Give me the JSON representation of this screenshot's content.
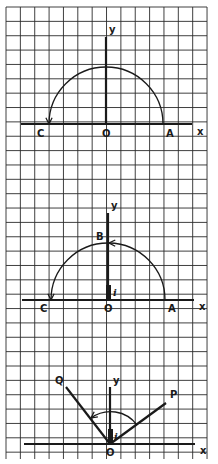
{
  "figure": {
    "grid": {
      "x0": 6,
      "y0": 7,
      "x1": 207,
      "y1": 459,
      "cell": 14.36,
      "color": "#2a2a2a"
    },
    "ink_color": "#1a1a1a",
    "panels": [
      {
        "id": "top",
        "description": "Rotation of point A through 180 degrees to C (multiplication by -1)",
        "origin": {
          "x": 106,
          "y": 124
        },
        "x_axis": {
          "from": 21,
          "to": 192
        },
        "y_axis": {
          "top": 37
        },
        "arc": {
          "radius": 57,
          "from_deg": 0,
          "to_deg": 180,
          "arrow_at": "C"
        },
        "labels": {
          "y": "y",
          "x": "x",
          "origin": "O",
          "A": "A",
          "C": "C"
        }
      },
      {
        "id": "middle",
        "description": "Rotation of A through 90 degrees to B and then to C, with unit i on y-axis",
        "origin": {
          "x": 108,
          "y": 300
        },
        "x_axis": {
          "from": 22,
          "to": 194
        },
        "y_axis": {
          "top": 213
        },
        "arc": {
          "radius": 57,
          "from_deg": 0,
          "to_deg": 180,
          "arrow_at": [
            "B",
            "C"
          ]
        },
        "unit_segment": {
          "label": "i",
          "length": 15
        },
        "labels": {
          "y": "y",
          "x": "x",
          "origin": "O",
          "A": "A",
          "B": "B",
          "C": "C",
          "i": "i"
        }
      },
      {
        "id": "bottom",
        "description": "Rotation of vector OP to OQ by 90 degrees",
        "origin": {
          "x": 110,
          "y": 444
        },
        "x_axis": {
          "from": 24,
          "to": 195
        },
        "y_axis": {
          "top": 387
        },
        "vector_P": {
          "x": 166,
          "y": 403
        },
        "vector_Q": {
          "x": 66,
          "y": 387
        },
        "arc": {
          "radius": 30,
          "arrow_at": "Q"
        },
        "unit_segment": {
          "label": "i",
          "length": 15
        },
        "labels": {
          "y": "y",
          "x": "x",
          "origin": "O",
          "P": "P",
          "Q": "Q",
          "i": "i"
        }
      }
    ]
  }
}
